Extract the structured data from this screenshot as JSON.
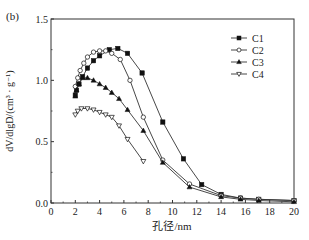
{
  "chart_data": {
    "type": "line",
    "panel_tag": "(b)",
    "title": "",
    "xlabel": "孔径/nm",
    "ylabel": "dV/dlgD/(cm³ · g⁻¹)",
    "xlim": [
      0,
      20
    ],
    "ylim": [
      0.0,
      1.5
    ],
    "xticks": [
      0,
      2,
      4,
      6,
      8,
      10,
      12,
      14,
      16,
      18,
      20
    ],
    "yticks": [
      0.0,
      0.5,
      1.0,
      1.5
    ],
    "ytick_labels": [
      "0.0",
      "0.5",
      "1.0",
      "1.5"
    ],
    "grid": false,
    "legend_position": "upper right",
    "series": [
      {
        "name": "C1",
        "marker": "filled-square",
        "points": [
          [
            2.0,
            0.88
          ],
          [
            2.1,
            0.92
          ],
          [
            2.3,
            0.97
          ],
          [
            2.6,
            1.03
          ],
          [
            3.0,
            1.1
          ],
          [
            3.5,
            1.16
          ],
          [
            4.0,
            1.2
          ],
          [
            4.8,
            1.25
          ],
          [
            5.5,
            1.26
          ],
          [
            6.3,
            1.22
          ],
          [
            7.5,
            1.06
          ],
          [
            9.2,
            0.66
          ],
          [
            10.9,
            0.36
          ],
          [
            12.4,
            0.15
          ],
          [
            14.0,
            0.07
          ],
          [
            15.6,
            0.04
          ],
          [
            17.1,
            0.03
          ],
          [
            20.0,
            0.02
          ]
        ]
      },
      {
        "name": "C2",
        "marker": "open-circle",
        "points": [
          [
            2.0,
            0.95
          ],
          [
            2.2,
            1.02
          ],
          [
            2.4,
            1.08
          ],
          [
            2.7,
            1.14
          ],
          [
            3.0,
            1.19
          ],
          [
            3.5,
            1.23
          ],
          [
            4.0,
            1.24
          ],
          [
            4.5,
            1.24
          ],
          [
            5.0,
            1.22
          ],
          [
            5.7,
            1.17
          ],
          [
            6.5,
            1.0
          ],
          [
            7.6,
            0.7
          ],
          [
            9.2,
            0.35
          ],
          [
            11.4,
            0.155
          ],
          [
            14.0,
            0.06
          ],
          [
            15.6,
            0.04
          ],
          [
            17.1,
            0.03
          ],
          [
            20.0,
            0.02
          ]
        ]
      },
      {
        "name": "C3",
        "marker": "filled-triangle-up",
        "points": [
          [
            2.0,
            0.87
          ],
          [
            2.1,
            0.92
          ],
          [
            2.3,
            0.97
          ],
          [
            2.6,
            1.02
          ],
          [
            3.0,
            1.02
          ],
          [
            3.5,
            1.0
          ],
          [
            4.0,
            0.97
          ],
          [
            4.5,
            0.94
          ],
          [
            5.0,
            0.9
          ],
          [
            5.6,
            0.85
          ],
          [
            6.3,
            0.76
          ],
          [
            7.6,
            0.59
          ],
          [
            9.2,
            0.33
          ],
          [
            11.4,
            0.13
          ],
          [
            14.0,
            0.05
          ],
          [
            15.6,
            0.03
          ],
          [
            17.1,
            0.02
          ],
          [
            20.0,
            0.01
          ]
        ]
      },
      {
        "name": "C4",
        "marker": "open-triangle-down",
        "points": [
          [
            2.0,
            0.72
          ],
          [
            2.2,
            0.75
          ],
          [
            2.5,
            0.77
          ],
          [
            3.0,
            0.77
          ],
          [
            3.5,
            0.76
          ],
          [
            4.0,
            0.74
          ],
          [
            4.5,
            0.72
          ],
          [
            5.0,
            0.7
          ],
          [
            5.6,
            0.63
          ],
          [
            6.3,
            0.52
          ],
          [
            7.6,
            0.34
          ]
        ]
      }
    ]
  },
  "style": {
    "line_color": "#333333",
    "axis_color": "#333333",
    "marker_fill": "#111111",
    "background": "#ffffff"
  }
}
